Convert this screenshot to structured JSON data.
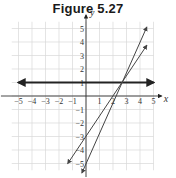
{
  "title": "Figure 5.27",
  "chart_data": {
    "type": "line",
    "title": "Figure 5.27",
    "xlabel": "x",
    "ylabel": "y",
    "xlim": [
      -5.5,
      5.5
    ],
    "ylim": [
      -5.5,
      5.5
    ],
    "grid": true,
    "x_ticks": [
      "-5",
      "-4",
      "-3",
      "-2",
      "-1",
      "1",
      "2",
      "3",
      "4",
      "5"
    ],
    "y_ticks": [
      "5",
      "4",
      "3",
      "2",
      "1",
      "-1",
      "-2",
      "-3",
      "-4",
      "-5"
    ],
    "series": [
      {
        "name": "horizontal line",
        "equation": "y = 1",
        "points": [
          [
            -5.0,
            1
          ],
          [
            5.0,
            1
          ]
        ],
        "color": "#222222",
        "width": "thick",
        "arrows": "both"
      },
      {
        "name": "line through (0,-3)",
        "equation": "y = 1.5x - 3",
        "points": [
          [
            -1.35,
            -5.0
          ],
          [
            4.5,
            3.75
          ]
        ],
        "color": "#444444",
        "arrows": "both"
      },
      {
        "name": "line through (0,-5)",
        "equation": "y = 2.25x - 5",
        "points": [
          [
            -0.3,
            -5.7
          ],
          [
            4.5,
            5.1
          ]
        ],
        "color": "#444444",
        "arrows": "both"
      }
    ],
    "intersection": {
      "x": 2.67,
      "y": 1
    }
  }
}
